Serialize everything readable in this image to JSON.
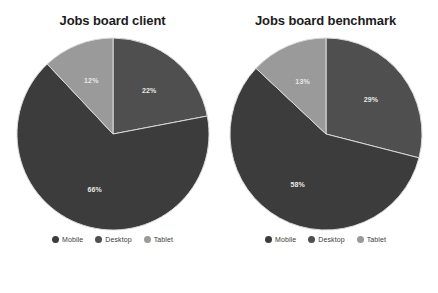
{
  "colors": {
    "mobile": "#3c3c3c",
    "desktop": "#4f4f4f",
    "tablet": "#9a9a9a",
    "label_text": "#e8e8e8",
    "title_text": "#1c1c1c",
    "background": "#ffffff"
  },
  "legend": {
    "items": [
      {
        "label": "Mobile",
        "color": "#3c3c3c"
      },
      {
        "label": "Desktop",
        "color": "#4f4f4f"
      },
      {
        "label": "Tablet",
        "color": "#9a9a9a"
      }
    ]
  },
  "panels": [
    {
      "title": "Jobs board client"
    },
    {
      "title": "Jobs board benchmark"
    }
  ],
  "chart_data": [
    {
      "type": "pie",
      "title": "Jobs board client",
      "categories": [
        "Desktop",
        "Mobile",
        "Tablet"
      ],
      "values": [
        22,
        66,
        12
      ],
      "labels": [
        "22%",
        "66%",
        "12%"
      ],
      "colors": [
        "#4f4f4f",
        "#3c3c3c",
        "#9a9a9a"
      ],
      "units": "percent",
      "total": 100,
      "start_angle_deg": 0,
      "direction": "clockwise",
      "legend_position": "bottom",
      "grid": false,
      "xlabel": "",
      "ylabel": ""
    },
    {
      "type": "pie",
      "title": "Jobs board benchmark",
      "categories": [
        "Desktop",
        "Mobile",
        "Tablet"
      ],
      "values": [
        29,
        58,
        13
      ],
      "labels": [
        "29%",
        "58%",
        "13%"
      ],
      "colors": [
        "#4f4f4f",
        "#3c3c3c",
        "#9a9a9a"
      ],
      "units": "percent",
      "total": 100,
      "start_angle_deg": 0,
      "direction": "clockwise",
      "legend_position": "bottom",
      "grid": false,
      "xlabel": "",
      "ylabel": ""
    }
  ]
}
